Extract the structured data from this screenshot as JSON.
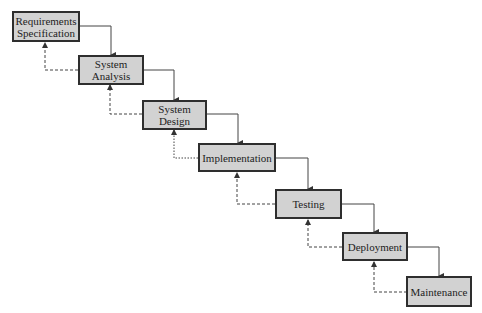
{
  "diagram": {
    "type": "waterfall-model",
    "colors": {
      "box_fill": "#d2d2d2",
      "box_border": "#2e2e2e",
      "line": "#444444",
      "background": "#ffffff"
    },
    "stages": [
      {
        "id": "requirements",
        "label": "Requirements\nSpecification"
      },
      {
        "id": "analysis",
        "label": "System\nAnalysis"
      },
      {
        "id": "design",
        "label": "System\nDesign"
      },
      {
        "id": "implementation",
        "label": "Implementation"
      },
      {
        "id": "testing",
        "label": "Testing"
      },
      {
        "id": "deployment",
        "label": "Deployment"
      },
      {
        "id": "maintenance",
        "label": "Maintenance"
      }
    ],
    "forward_arrows": "solid, from right side of each stage down to top of next stage",
    "feedback_arrows": "dashed, from left side of each stage up to bottom of previous stage"
  }
}
